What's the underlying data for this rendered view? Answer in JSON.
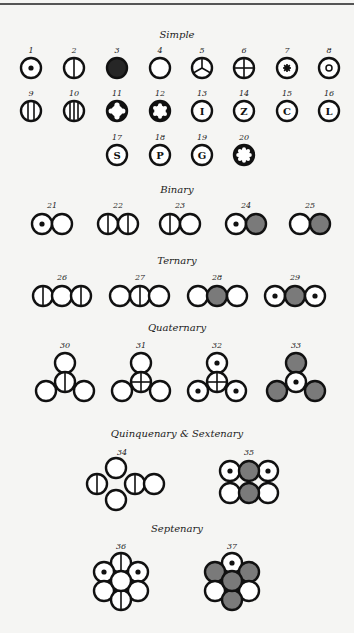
{
  "colors": {
    "background": "#f5f5f3",
    "ink": "#111111",
    "hatched_fill": "#7a7a7a",
    "solid_fill": "#262626"
  },
  "sections": [
    {
      "title": "Simple",
      "y": 38
    },
    {
      "title": "Binary",
      "y": 193
    },
    {
      "title": "Ternary",
      "y": 264
    },
    {
      "title": "Quaternary",
      "y": 331
    },
    {
      "title": "Quinquenary & Sextenary",
      "y": 437
    },
    {
      "title": "Septenary",
      "y": 532
    }
  ],
  "symbols": [
    {
      "n": "1",
      "x": 31,
      "y": 68,
      "type": "dot"
    },
    {
      "n": "2",
      "x": 74,
      "y": 68,
      "type": "vline"
    },
    {
      "n": "3",
      "x": 117,
      "y": 68,
      "type": "black"
    },
    {
      "n": "4",
      "x": 160,
      "y": 68,
      "type": "plain"
    },
    {
      "n": "5",
      "x": 202,
      "y": 68,
      "type": "tri"
    },
    {
      "n": "6",
      "x": 244,
      "y": 68,
      "type": "cross"
    },
    {
      "n": "7",
      "x": 287,
      "y": 68,
      "type": "star"
    },
    {
      "n": "8",
      "x": 329,
      "y": 68,
      "type": "ring"
    },
    {
      "n": "9",
      "x": 31,
      "y": 111,
      "type": "vlines2"
    },
    {
      "n": "10",
      "x": 74,
      "y": 111,
      "type": "vlines3"
    },
    {
      "n": "11",
      "x": 117,
      "y": 111,
      "type": "cog4"
    },
    {
      "n": "12",
      "x": 160,
      "y": 111,
      "type": "cog6"
    },
    {
      "n": "13",
      "x": 202,
      "y": 111,
      "type": "letter",
      "letter": "I"
    },
    {
      "n": "14",
      "x": 244,
      "y": 111,
      "type": "letter",
      "letter": "Z"
    },
    {
      "n": "15",
      "x": 287,
      "y": 111,
      "type": "letter",
      "letter": "C"
    },
    {
      "n": "16",
      "x": 329,
      "y": 111,
      "type": "letter",
      "letter": "L"
    },
    {
      "n": "17",
      "x": 117,
      "y": 155,
      "type": "letter",
      "letter": "S"
    },
    {
      "n": "18",
      "x": 160,
      "y": 155,
      "type": "letter",
      "letter": "P"
    },
    {
      "n": "19",
      "x": 202,
      "y": 155,
      "type": "letter",
      "letter": "G"
    },
    {
      "n": "20",
      "x": 244,
      "y": 155,
      "type": "cog8"
    }
  ],
  "compounds": [
    {
      "n": "21",
      "label_x": 52,
      "label_y": 208,
      "atoms": [
        {
          "x": 42,
          "y": 224,
          "type": "dot"
        },
        {
          "x": 62,
          "y": 224,
          "type": "plain"
        }
      ]
    },
    {
      "n": "22",
      "label_x": 118,
      "label_y": 208,
      "atoms": [
        {
          "x": 108,
          "y": 224,
          "type": "vline"
        },
        {
          "x": 128,
          "y": 224,
          "type": "vline"
        }
      ]
    },
    {
      "n": "23",
      "label_x": 180,
      "label_y": 208,
      "atoms": [
        {
          "x": 170,
          "y": 224,
          "type": "vline"
        },
        {
          "x": 190,
          "y": 224,
          "type": "plain"
        }
      ]
    },
    {
      "n": "24",
      "label_x": 246,
      "label_y": 208,
      "atoms": [
        {
          "x": 236,
          "y": 224,
          "type": "dot"
        },
        {
          "x": 256,
          "y": 224,
          "type": "hatch"
        }
      ]
    },
    {
      "n": "25",
      "label_x": 310,
      "label_y": 208,
      "atoms": [
        {
          "x": 300,
          "y": 224,
          "type": "plain"
        },
        {
          "x": 320,
          "y": 224,
          "type": "hatch"
        }
      ]
    },
    {
      "n": "26",
      "label_x": 62,
      "label_y": 280,
      "atoms": [
        {
          "x": 43,
          "y": 296,
          "type": "vline"
        },
        {
          "x": 62,
          "y": 296,
          "type": "plain"
        },
        {
          "x": 81,
          "y": 296,
          "type": "vline"
        }
      ]
    },
    {
      "n": "27",
      "label_x": 140,
      "label_y": 280,
      "atoms": [
        {
          "x": 120,
          "y": 296,
          "type": "plain"
        },
        {
          "x": 140,
          "y": 296,
          "type": "vline"
        },
        {
          "x": 159,
          "y": 296,
          "type": "plain"
        }
      ]
    },
    {
      "n": "28",
      "label_x": 217,
      "label_y": 280,
      "atoms": [
        {
          "x": 198,
          "y": 296,
          "type": "plain"
        },
        {
          "x": 217,
          "y": 296,
          "type": "hatch"
        },
        {
          "x": 237,
          "y": 296,
          "type": "plain"
        }
      ]
    },
    {
      "n": "29",
      "label_x": 295,
      "label_y": 280,
      "atoms": [
        {
          "x": 275,
          "y": 296,
          "type": "dot"
        },
        {
          "x": 295,
          "y": 296,
          "type": "hatch"
        },
        {
          "x": 315,
          "y": 296,
          "type": "dot"
        }
      ]
    },
    {
      "n": "30",
      "label_x": 65,
      "label_y": 348,
      "atoms": [
        {
          "x": 65,
          "y": 363,
          "type": "plain"
        },
        {
          "x": 46,
          "y": 391,
          "type": "plain"
        },
        {
          "x": 84,
          "y": 391,
          "type": "plain"
        },
        {
          "x": 65,
          "y": 382,
          "type": "vline"
        }
      ]
    },
    {
      "n": "31",
      "label_x": 141,
      "label_y": 348,
      "atoms": [
        {
          "x": 141,
          "y": 363,
          "type": "plain"
        },
        {
          "x": 122,
          "y": 391,
          "type": "plain"
        },
        {
          "x": 160,
          "y": 391,
          "type": "plain"
        },
        {
          "x": 141,
          "y": 382,
          "type": "cross"
        }
      ]
    },
    {
      "n": "32",
      "label_x": 217,
      "label_y": 348,
      "atoms": [
        {
          "x": 217,
          "y": 363,
          "type": "dot"
        },
        {
          "x": 198,
          "y": 391,
          "type": "dot"
        },
        {
          "x": 236,
          "y": 391,
          "type": "dot"
        },
        {
          "x": 217,
          "y": 382,
          "type": "cross"
        }
      ]
    },
    {
      "n": "33",
      "label_x": 296,
      "label_y": 348,
      "atoms": [
        {
          "x": 296,
          "y": 363,
          "type": "hatch"
        },
        {
          "x": 277,
          "y": 391,
          "type": "hatch"
        },
        {
          "x": 315,
          "y": 391,
          "type": "hatch"
        },
        {
          "x": 296,
          "y": 382,
          "type": "dot"
        }
      ]
    },
    {
      "n": "34",
      "label_x": 122,
      "label_y": 455,
      "atoms": [
        {
          "x": 116,
          "y": 468,
          "type": "plain"
        },
        {
          "x": 116,
          "y": 500,
          "type": "plain"
        },
        {
          "x": 97,
          "y": 484,
          "type": "vline"
        },
        {
          "x": 135,
          "y": 484,
          "type": "vline"
        },
        {
          "x": 154,
          "y": 484,
          "type": "plain"
        }
      ]
    },
    {
      "n": "35",
      "label_x": 249,
      "label_y": 455,
      "atoms": [
        {
          "x": 230,
          "y": 471,
          "type": "dot"
        },
        {
          "x": 268,
          "y": 471,
          "type": "dot"
        },
        {
          "x": 230,
          "y": 493,
          "type": "plain"
        },
        {
          "x": 268,
          "y": 493,
          "type": "plain"
        },
        {
          "x": 249,
          "y": 471,
          "type": "hatch"
        },
        {
          "x": 249,
          "y": 493,
          "type": "hatch"
        }
      ]
    },
    {
      "n": "36",
      "label_x": 121,
      "label_y": 549,
      "atoms": [
        {
          "x": 121,
          "y": 563,
          "type": "vline"
        },
        {
          "x": 104,
          "y": 572,
          "type": "dot"
        },
        {
          "x": 138,
          "y": 572,
          "type": "dot"
        },
        {
          "x": 104,
          "y": 591,
          "type": "plain"
        },
        {
          "x": 138,
          "y": 591,
          "type": "plain"
        },
        {
          "x": 121,
          "y": 600,
          "type": "vline"
        },
        {
          "x": 121,
          "y": 581,
          "type": "plain"
        }
      ]
    },
    {
      "n": "37",
      "label_x": 232,
      "label_y": 549,
      "atoms": [
        {
          "x": 232,
          "y": 563,
          "type": "dot"
        },
        {
          "x": 215,
          "y": 572,
          "type": "hatch"
        },
        {
          "x": 249,
          "y": 572,
          "type": "hatch"
        },
        {
          "x": 215,
          "y": 591,
          "type": "plain"
        },
        {
          "x": 249,
          "y": 591,
          "type": "plain"
        },
        {
          "x": 232,
          "y": 600,
          "type": "hatch"
        },
        {
          "x": 232,
          "y": 581,
          "type": "hatch"
        }
      ]
    }
  ]
}
